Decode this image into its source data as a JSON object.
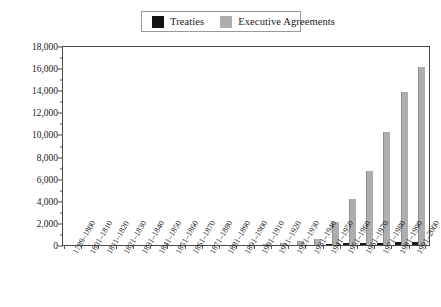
{
  "legend": {
    "entries": [
      {
        "label": "Treaties",
        "color": "#191410",
        "key": "treaties"
      },
      {
        "label": "Executive Agreements",
        "color": "#aeaeae",
        "key": "executive_agreements"
      }
    ]
  },
  "axis": {
    "y_ticks": [
      "18,000",
      "16,000",
      "14,000",
      "12,000",
      "10,000",
      "8,000",
      "6,000",
      "4,000",
      "2,000",
      "0"
    ],
    "y_tick_values": [
      18000,
      16000,
      14000,
      12000,
      10000,
      8000,
      6000,
      4000,
      2000,
      0
    ],
    "y_minor_step": 1000
  },
  "chart_data": {
    "type": "bar",
    "title": "",
    "subtitle": "",
    "xlabel": "",
    "ylabel": "",
    "ylim": [
      0,
      18000
    ],
    "ytick_step": 2000,
    "grid": false,
    "legend_position": "top-center",
    "categories": [
      "1789–1800",
      "1801–1810",
      "1811–1820",
      "1821–1830",
      "1831–1840",
      "1841–1850",
      "1851–1860",
      "1861–1870",
      "1871–1880",
      "1881–1890",
      "1891–1900",
      "1901–1910",
      "1911–1920",
      "1921–1930",
      "1931–1940",
      "1941–1950",
      "1951–1960",
      "1961–1970",
      "1971–1980",
      "1981–1990",
      "1991–2000"
    ],
    "series": [
      {
        "name": "Treaties",
        "color": "#191410",
        "values": [
          20,
          27,
          27,
          32,
          28,
          37,
          47,
          58,
          50,
          61,
          85,
          114,
          97,
          103,
          110,
          190,
          230,
          270,
          315,
          340,
          360
        ]
      },
      {
        "name": "Executive Agreements",
        "color": "#aeaeae",
        "values": [
          27,
          31,
          37,
          38,
          40,
          46,
          53,
          64,
          74,
          86,
          119,
          175,
          285,
          480,
          660,
          2150,
          4250,
          6800,
          10300,
          13900,
          16200
        ]
      }
    ]
  }
}
